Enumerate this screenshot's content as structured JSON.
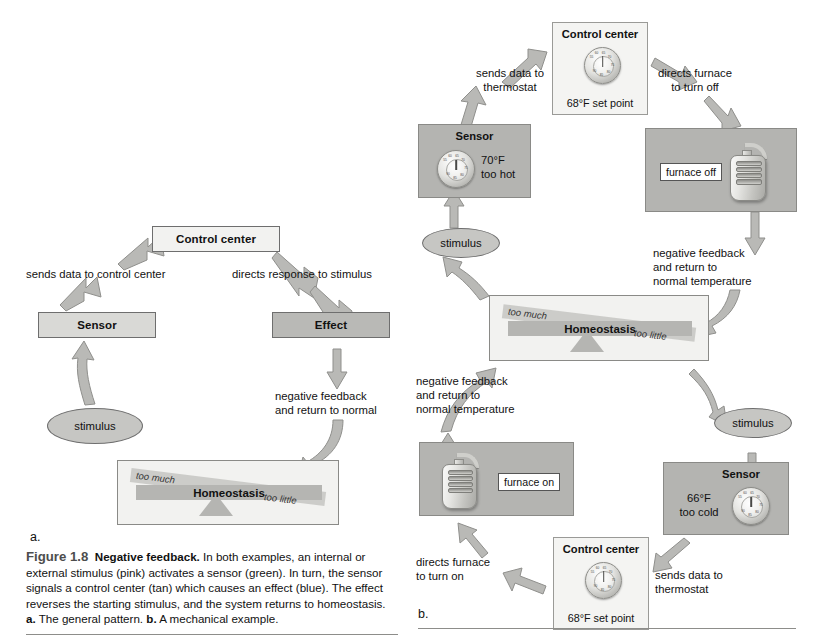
{
  "figure": {
    "number": "Figure 1.8",
    "title": "Negative feedback.",
    "body_1": " In both examples, an internal or external stimulus (pink) activates a sensor (green). In turn, the sensor signals a control center (tan) which causes an effect (blue). The effect reverses the starting stimulus, and the system returns to homeostasis. ",
    "a_marker": "a.",
    "a_desc": " The general pattern. ",
    "b_marker": "b.",
    "b_desc": " A mechanical example.",
    "panel_a_letter": "a.",
    "panel_b_letter": "b."
  },
  "panel_a": {
    "control_center": "Control center",
    "sensor": "Sensor",
    "effect": "Effect",
    "stimulus": "stimulus",
    "arrow_sensor_to_control": "sends data to control center",
    "arrow_control_to_effect": "directs response to stimulus",
    "arrow_effect_feedback_l1": "negative feedback",
    "arrow_effect_feedback_l2": "and return to normal",
    "homeostasis": {
      "label": "Homeostasis",
      "too_much": "too much",
      "too_little": "too little"
    }
  },
  "panel_b": {
    "control_center_top": {
      "title": "Control center",
      "setpoint": "68°F set point",
      "dial_ticks": [
        "55",
        "60",
        "65",
        "70",
        "75",
        "80",
        "85",
        "90"
      ]
    },
    "control_center_bottom": {
      "title": "Control center",
      "setpoint": "68°F set point"
    },
    "sensor_top": {
      "title": "Sensor",
      "reading_line1": "70°F",
      "reading_line2": "too hot"
    },
    "sensor_bottom": {
      "title": "Sensor",
      "reading_line1": "66°F",
      "reading_line2": "too cold"
    },
    "furnace_off": "furnace off",
    "furnace_on": "furnace on",
    "stimulus_left": "stimulus",
    "stimulus_right": "stimulus",
    "labels": {
      "sends_data_top_l1": "sends data to",
      "sends_data_top_l2": "thermostat",
      "directs_off_l1": "directs furnace",
      "directs_off_l2": "to turn off",
      "feedback_right_l1": "negative feedback",
      "feedback_right_l2": "and return to",
      "feedback_right_l3": "normal temperature",
      "feedback_left_l1": "negative feedback",
      "feedback_left_l2": "and return to",
      "feedback_left_l3": "normal temperature",
      "directs_on_l1": "directs furnace",
      "directs_on_l2": "to turn on",
      "sends_data_bottom_l1": "sends data to",
      "sends_data_bottom_l2": "thermostat"
    },
    "homeostasis": {
      "label": "Homeostasis",
      "too_much": "too much",
      "too_little": "too little"
    }
  },
  "colors": {
    "box_light": "#f2f2f0",
    "box_mid": "#d9d9d6",
    "box_dark": "#b9b9b6",
    "photo_bg": "#b4b4b1",
    "arrow": "#b9b9b6",
    "caption_title": "#4d4d4d"
  }
}
